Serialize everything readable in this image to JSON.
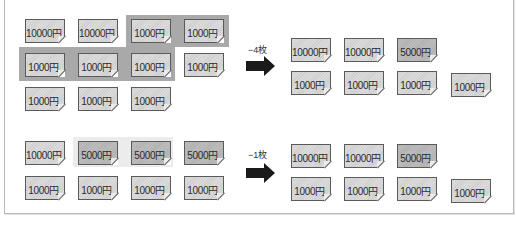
{
  "diagram": {
    "currency_symbol": "円",
    "colors": {
      "highlight_dark": "#a9a9a9",
      "highlight_light": "#ececec",
      "card": "#d6d6d6",
      "card_dark": "#b8b8b8",
      "arrow": "#1a1a1a"
    },
    "example1": {
      "before": [
        {
          "label": "10000円",
          "dark": false
        },
        {
          "label": "10000円",
          "dark": false
        },
        {
          "label": "1000円",
          "dark": false
        },
        {
          "label": "1000円",
          "dark": false
        },
        {
          "label": "1000円",
          "dark": false
        },
        {
          "label": "1000円",
          "dark": false
        },
        {
          "label": "1000円",
          "dark": false
        },
        {
          "label": "1000円",
          "dark": false
        },
        {
          "label": "1000円",
          "dark": false
        },
        {
          "label": "1000円",
          "dark": false
        },
        {
          "label": "1000円",
          "dark": false
        }
      ],
      "operation": "−4枚",
      "after": [
        {
          "label": "10000円",
          "dark": false
        },
        {
          "label": "10000円",
          "dark": false
        },
        {
          "label": "5000円",
          "dark": true
        },
        {
          "label": "1000円",
          "dark": false
        },
        {
          "label": "1000円",
          "dark": false
        },
        {
          "label": "1000円",
          "dark": false
        },
        {
          "label": "1000円",
          "dark": false
        }
      ]
    },
    "example2": {
      "before": [
        {
          "label": "10000円",
          "dark": false
        },
        {
          "label": "5000円",
          "dark": true
        },
        {
          "label": "5000円",
          "dark": true
        },
        {
          "label": "5000円",
          "dark": true
        },
        {
          "label": "1000円",
          "dark": false
        },
        {
          "label": "1000円",
          "dark": false
        },
        {
          "label": "1000円",
          "dark": false
        },
        {
          "label": "1000円",
          "dark": false
        }
      ],
      "operation": "−1枚",
      "after": [
        {
          "label": "10000円",
          "dark": false
        },
        {
          "label": "10000円",
          "dark": false
        },
        {
          "label": "5000円",
          "dark": true
        },
        {
          "label": "1000円",
          "dark": false
        },
        {
          "label": "1000円",
          "dark": false
        },
        {
          "label": "1000円",
          "dark": false
        },
        {
          "label": "1000円",
          "dark": false
        }
      ]
    }
  }
}
